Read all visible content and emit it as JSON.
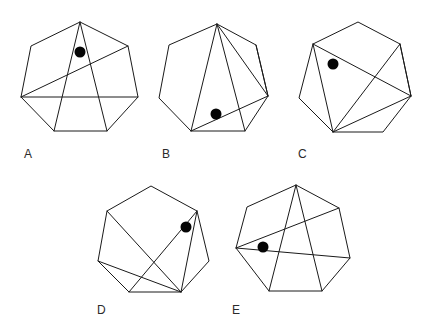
{
  "figure": {
    "background_color": "#ffffff",
    "line_color": "#1a1a1a",
    "dot_color": "#050505",
    "label_color": "#2b2b2b",
    "option_count": 5,
    "shape_type": "heptagon",
    "dot_radius": 5.5
  },
  "options": [
    {
      "id": "A",
      "label": "A",
      "label_x": 24,
      "label_y": 158,
      "vertices": [
        [
          80,
          22
        ],
        [
          128,
          46
        ],
        [
          138,
          97
        ],
        [
          107,
          131
        ],
        [
          54,
          131
        ],
        [
          21,
          97
        ],
        [
          31,
          46
        ]
      ],
      "chords": [
        {
          "from": 0,
          "to": 4,
          "name": "chord-top-to-lower-left"
        },
        {
          "from": 0,
          "to": 3,
          "name": "chord-top-to-lower-right"
        },
        {
          "from": 5,
          "to": 1,
          "name": "chord-left-to-upper-right"
        },
        {
          "from": 5,
          "to": 2,
          "name": "chord-left-to-right"
        }
      ],
      "dot": {
        "x": 80,
        "y": 52
      }
    },
    {
      "id": "B",
      "label": "B",
      "label_x": 162,
      "label_y": 158,
      "vertices": [
        [
          217,
          24
        ],
        [
          256,
          45
        ],
        [
          268,
          96
        ],
        [
          245,
          131
        ],
        [
          191,
          131
        ],
        [
          159,
          98
        ],
        [
          169,
          45
        ]
      ],
      "chords": [
        {
          "from": 0,
          "to": 4,
          "name": "chord-top-to-lower-left"
        },
        {
          "from": 0,
          "to": 3,
          "name": "chord-top-to-lower-right"
        },
        {
          "from": 0,
          "to": 2,
          "name": "chord-top-to-right"
        },
        {
          "from": 1,
          "to": 2,
          "name": "chord-upper-right-to-right"
        },
        {
          "from": 4,
          "to": 2,
          "name": "chord-lower-left-to-right"
        }
      ],
      "dot": {
        "x": 216,
        "y": 114
      }
    },
    {
      "id": "C",
      "label": "C",
      "label_x": 298,
      "label_y": 158,
      "vertices": [
        [
          358,
          22
        ],
        [
          400,
          44
        ],
        [
          411,
          96
        ],
        [
          383,
          132
        ],
        [
          333,
          132
        ],
        [
          299,
          98
        ],
        [
          313,
          44
        ]
      ],
      "chords": [
        {
          "from": 6,
          "to": 2,
          "name": "chord-upper-left-to-right"
        },
        {
          "from": 6,
          "to": 4,
          "name": "chord-upper-left-to-lower-left"
        },
        {
          "from": 1,
          "to": 2,
          "name": "chord-upper-right-to-right"
        },
        {
          "from": 2,
          "to": 4,
          "name": "chord-right-to-lower-left"
        },
        {
          "from": 1,
          "to": 4,
          "name": "chord-upper-right-to-lower-left"
        }
      ],
      "dot": {
        "x": 333,
        "y": 64
      }
    },
    {
      "id": "D",
      "label": "D",
      "label_x": 97,
      "label_y": 314,
      "vertices": [
        [
          151,
          186
        ],
        [
          197,
          211
        ],
        [
          209,
          261
        ],
        [
          181,
          292
        ],
        [
          129,
          292
        ],
        [
          98,
          261
        ],
        [
          107,
          211
        ]
      ],
      "chords": [
        {
          "from": 6,
          "to": 3,
          "name": "chord-upper-left-to-lower-right"
        },
        {
          "from": 5,
          "to": 3,
          "name": "chord-left-to-lower-right"
        },
        {
          "from": 4,
          "to": 1,
          "name": "chord-lower-left-to-upper-right"
        },
        {
          "from": 1,
          "to": 3,
          "name": "chord-upper-right-to-lower-right"
        }
      ],
      "dot": {
        "x": 186,
        "y": 227
      }
    },
    {
      "id": "E",
      "label": "E",
      "label_x": 232,
      "label_y": 314,
      "vertices": [
        [
          296,
          185
        ],
        [
          339,
          208
        ],
        [
          350,
          258
        ],
        [
          322,
          291
        ],
        [
          269,
          291
        ],
        [
          236,
          248
        ],
        [
          247,
          207
        ]
      ],
      "chords": [
        {
          "from": 0,
          "to": 4,
          "name": "chord-top-to-lower-left"
        },
        {
          "from": 0,
          "to": 3,
          "name": "chord-top-to-lower-right"
        },
        {
          "from": 5,
          "to": 1,
          "name": "chord-left-to-upper-right"
        },
        {
          "from": 5,
          "to": 2,
          "name": "chord-left-to-right"
        }
      ],
      "dot": {
        "x": 263,
        "y": 247
      }
    }
  ]
}
